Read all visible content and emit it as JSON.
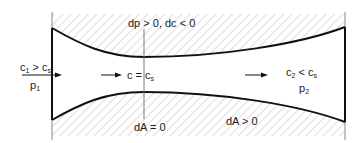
{
  "diagram": {
    "type": "converging-diverging nozzle (de Laval)",
    "colors": {
      "wall": "#111111",
      "hatch": "#c8c8c8",
      "reference_line": "#777777",
      "text": "#222222"
    },
    "labels": {
      "inlet_condition": {
        "main": "c",
        "sub1": "1",
        "op": " > c",
        "sub2": "s"
      },
      "inlet_pressure": {
        "main": "p",
        "sub": "1"
      },
      "throat_condition": {
        "main": "c = c",
        "sub": "s"
      },
      "outlet_condition": {
        "main": "c",
        "sub1": "2",
        "op": " < c",
        "sub2": "s"
      },
      "outlet_pressure": {
        "main": "p",
        "sub": "2"
      },
      "top_annotation": "dp > 0, dc < 0",
      "throat_area": "dA = 0",
      "diverging_area": "dA > 0"
    }
  }
}
